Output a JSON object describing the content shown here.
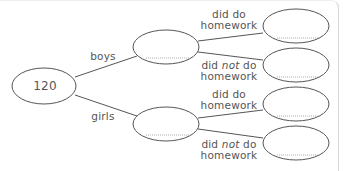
{
  "diagram": {
    "type": "tree-diagram",
    "root": {
      "value": "120"
    },
    "branches": [
      {
        "label": "boys",
        "value": "",
        "children": [
          {
            "label_line1": "did do",
            "label_line2": "homework",
            "value": ""
          },
          {
            "label_pre": "did ",
            "label_em": "not",
            "label_post": " do",
            "label_line2": "homework",
            "value": ""
          }
        ]
      },
      {
        "label": "girls",
        "value": "",
        "children": [
          {
            "label_line1": "did do",
            "label_line2": "homework",
            "value": ""
          },
          {
            "label_pre": "did ",
            "label_em": "not",
            "label_post": " do",
            "label_line2": "homework",
            "value": ""
          }
        ]
      }
    ],
    "colors": {
      "stroke": "#555555",
      "text": "#555555",
      "dotted": "#999999"
    }
  }
}
